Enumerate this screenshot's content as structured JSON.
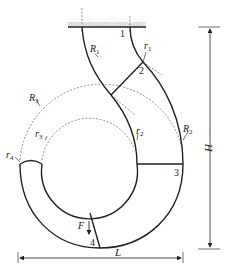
{
  "diagram": {
    "colors": {
      "line": "#222222",
      "background": "#ffffff"
    },
    "radius_labels": {
      "R1": {
        "base": "R",
        "sub": "1"
      },
      "r1": {
        "base": "r",
        "sub": "1"
      },
      "R2": {
        "base": "R",
        "sub": "2"
      },
      "r2": {
        "base": "r",
        "sub": "2"
      },
      "R3": {
        "base": "R",
        "sub": "3"
      },
      "r3": {
        "base": "r",
        "sub": "3"
      },
      "r4": {
        "base": "r",
        "sub": "4"
      }
    },
    "section_labels": [
      "1",
      "2",
      "3",
      "4"
    ],
    "force_label": "F",
    "dimensions": {
      "height": "H",
      "length": "L"
    }
  }
}
